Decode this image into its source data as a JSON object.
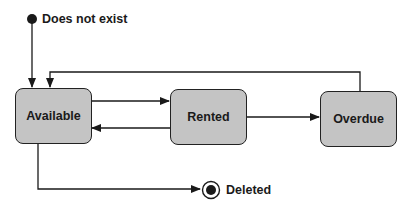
{
  "diagram": {
    "type": "state-machine",
    "initial_state": {
      "label": "Does not exist"
    },
    "final_state": {
      "label": "Deleted"
    },
    "states": [
      {
        "id": "available",
        "label": "Available"
      },
      {
        "id": "rented",
        "label": "Rented"
      },
      {
        "id": "overdue",
        "label": "Overdue"
      }
    ],
    "transitions": [
      {
        "from": "Does not exist",
        "to": "Available"
      },
      {
        "from": "Available",
        "to": "Rented"
      },
      {
        "from": "Rented",
        "to": "Available"
      },
      {
        "from": "Rented",
        "to": "Overdue"
      },
      {
        "from": "Overdue",
        "to": "Available"
      },
      {
        "from": "Available",
        "to": "Deleted"
      }
    ],
    "colors": {
      "state_fill": "#c4c4c4",
      "stroke": "#1a1a1a"
    }
  }
}
